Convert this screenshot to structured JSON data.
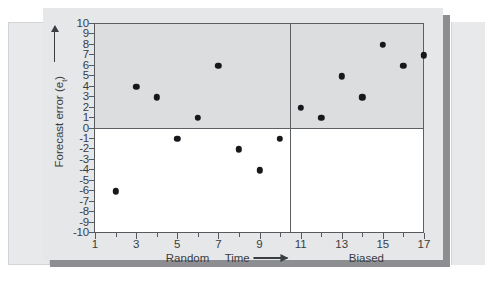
{
  "chart_data": {
    "type": "scatter",
    "title": "",
    "xlabel": "Time",
    "ylabel": "Forecast error (e_t)",
    "ylabel_main": "Forecast error (e",
    "ylabel_sub": "t",
    "ylabel_tail": ")",
    "xlim": [
      1,
      17
    ],
    "ylim": [
      -10,
      10
    ],
    "grid": false,
    "zero_line": 0,
    "x": [
      2,
      3,
      4,
      5,
      6,
      7,
      8,
      9,
      10,
      11,
      12,
      13,
      14,
      15,
      16,
      17
    ],
    "values": [
      -6,
      4,
      3,
      -1,
      1,
      6,
      -2,
      -4,
      -1,
      2,
      1,
      5,
      3,
      8,
      6,
      7
    ],
    "y_ticks": [
      10,
      9,
      8,
      7,
      6,
      5,
      4,
      3,
      2,
      1,
      0,
      -1,
      -2,
      -3,
      -4,
      -5,
      -6,
      -7,
      -8,
      -9,
      -10
    ],
    "y_tick_labels": [
      "10",
      "9",
      "8",
      "7",
      "6",
      "5",
      "4",
      "3",
      "2",
      "1",
      "0",
      "-1",
      "-2",
      "-3",
      "-4",
      "-5",
      "-6",
      "-7",
      "-8",
      "-9",
      "-10"
    ],
    "x_major_ticks": [
      1,
      3,
      5,
      7,
      9,
      11,
      13,
      15,
      17
    ],
    "x_major_labels": [
      "1",
      "3",
      "5",
      "7",
      "9",
      "11",
      "13",
      "15",
      "17"
    ],
    "x_minor_ticks": [
      2,
      4,
      6,
      8,
      10,
      12,
      14,
      16
    ],
    "regions": [
      {
        "label": "Random",
        "start": 1,
        "end": 10.5,
        "center": 5.5
      },
      {
        "label": "Biased",
        "start": 10.5,
        "end": 17,
        "center": 14.2
      }
    ],
    "divider_x": 10.5,
    "annotations": {
      "x_axis_title": "Time",
      "y_axis_arrow": "up-arrow",
      "x_axis_arrow": "right-arrow"
    },
    "colors": {
      "point": "#16181b",
      "axis": "#56595d",
      "shaded_positive": "#dcdddf",
      "plot_background": "#ffffff",
      "card_background": "#e6e7e9",
      "page_background": "#ffffff"
    }
  }
}
